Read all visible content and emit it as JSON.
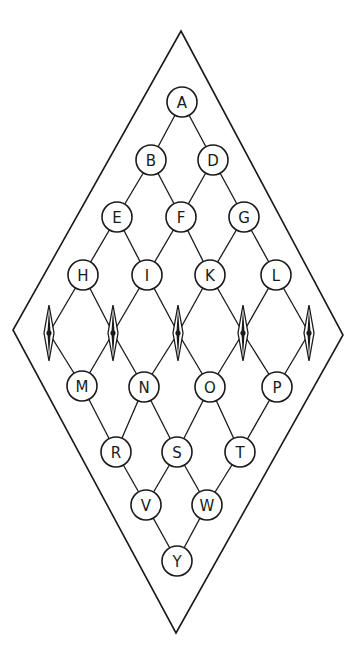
{
  "diagram": {
    "outer_shape": "rhombus",
    "outer_vertices": {
      "top": [
        181,
        31
      ],
      "right": [
        343,
        335
      ],
      "bottom": [
        176,
        633
      ],
      "left": [
        13,
        330
      ]
    },
    "node_radius": 15,
    "nodes": [
      {
        "id": "A",
        "label": "A",
        "x": 182,
        "y": 102
      },
      {
        "id": "B",
        "label": "B",
        "x": 151,
        "y": 160
      },
      {
        "id": "D",
        "label": "D",
        "x": 213,
        "y": 160
      },
      {
        "id": "E",
        "label": "E",
        "x": 117,
        "y": 217
      },
      {
        "id": "F",
        "label": "F",
        "x": 181,
        "y": 217
      },
      {
        "id": "G",
        "label": "G",
        "x": 244,
        "y": 217
      },
      {
        "id": "H",
        "label": "H",
        "x": 83,
        "y": 275
      },
      {
        "id": "I",
        "label": "I",
        "x": 147,
        "y": 275
      },
      {
        "id": "K",
        "label": "K",
        "x": 210,
        "y": 275
      },
      {
        "id": "L",
        "label": "L",
        "x": 276,
        "y": 275
      },
      {
        "id": "M",
        "label": "M",
        "x": 82,
        "y": 386
      },
      {
        "id": "N",
        "label": "N",
        "x": 144,
        "y": 387
      },
      {
        "id": "O",
        "label": "O",
        "x": 210,
        "y": 387
      },
      {
        "id": "P",
        "label": "P",
        "x": 277,
        "y": 387
      },
      {
        "id": "R",
        "label": "R",
        "x": 116,
        "y": 452
      },
      {
        "id": "S",
        "label": "S",
        "x": 177,
        "y": 452
      },
      {
        "id": "T",
        "label": "T",
        "x": 240,
        "y": 452
      },
      {
        "id": "V",
        "label": "V",
        "x": 146,
        "y": 505
      },
      {
        "id": "W",
        "label": "W",
        "x": 207,
        "y": 505
      },
      {
        "id": "Y",
        "label": "Y",
        "x": 177,
        "y": 561
      }
    ],
    "lozenges": [
      {
        "id": "Z1",
        "x": 49,
        "y": 333
      },
      {
        "id": "Z2",
        "x": 113,
        "y": 333
      },
      {
        "id": "Z3",
        "x": 178,
        "y": 333
      },
      {
        "id": "Z4",
        "x": 243,
        "y": 333
      },
      {
        "id": "Z5",
        "x": 309,
        "y": 333
      }
    ],
    "edges": [
      [
        "A",
        "B"
      ],
      [
        "A",
        "D"
      ],
      [
        "B",
        "E"
      ],
      [
        "B",
        "F"
      ],
      [
        "D",
        "F"
      ],
      [
        "D",
        "G"
      ],
      [
        "E",
        "H"
      ],
      [
        "E",
        "I"
      ],
      [
        "F",
        "I"
      ],
      [
        "F",
        "K"
      ],
      [
        "G",
        "K"
      ],
      [
        "G",
        "L"
      ],
      [
        "H",
        "Z1"
      ],
      [
        "H",
        "Z2"
      ],
      [
        "I",
        "Z2"
      ],
      [
        "I",
        "Z3"
      ],
      [
        "K",
        "Z3"
      ],
      [
        "K",
        "Z4"
      ],
      [
        "L",
        "Z4"
      ],
      [
        "L",
        "Z5"
      ],
      [
        "Z1",
        "M"
      ],
      [
        "Z2",
        "M"
      ],
      [
        "Z2",
        "N"
      ],
      [
        "Z3",
        "N"
      ],
      [
        "Z3",
        "O"
      ],
      [
        "Z4",
        "O"
      ],
      [
        "Z4",
        "P"
      ],
      [
        "Z5",
        "P"
      ],
      [
        "M",
        "R"
      ],
      [
        "N",
        "R"
      ],
      [
        "N",
        "S"
      ],
      [
        "O",
        "S"
      ],
      [
        "O",
        "T"
      ],
      [
        "P",
        "T"
      ],
      [
        "R",
        "V"
      ],
      [
        "S",
        "V"
      ],
      [
        "S",
        "W"
      ],
      [
        "T",
        "W"
      ],
      [
        "V",
        "Y"
      ],
      [
        "W",
        "Y"
      ]
    ],
    "colors": {
      "stroke": "#1a1a1a",
      "background": "#ffffff"
    }
  }
}
